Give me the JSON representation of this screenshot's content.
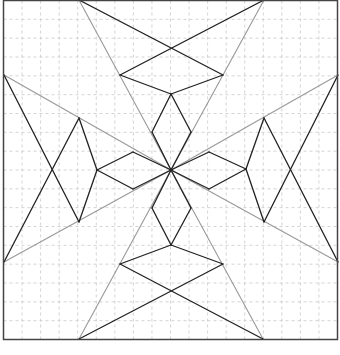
{
  "diagram": {
    "title": "",
    "frame": {
      "x": 3.5,
      "y": 0.5,
      "width": 334,
      "height": 339,
      "stroke": "#444444",
      "stroke_width": 1.5
    },
    "grid": {
      "divisions": 18,
      "stroke": "#c8c8c8",
      "dash": "3,3",
      "stroke_width": 0.8
    },
    "colors": {
      "black_line": "#222222",
      "gray_line": "#999999"
    },
    "center": [
      171,
      170
    ],
    "black_lines": [
      [
        79,
        0,
        223,
        75
      ],
      [
        264,
        0,
        120,
        75
      ],
      [
        120,
        75,
        171,
        94
      ],
      [
        223,
        75,
        171,
        94
      ],
      [
        171,
        94,
        152,
        132
      ],
      [
        152,
        132,
        171,
        170
      ],
      [
        171,
        94,
        191,
        132
      ],
      [
        191,
        132,
        171,
        170
      ],
      [
        79,
        339,
        223,
        264
      ],
      [
        263,
        339,
        120,
        264
      ],
      [
        120,
        264,
        171,
        245
      ],
      [
        223,
        264,
        171,
        245
      ],
      [
        171,
        245,
        152,
        208
      ],
      [
        152,
        208,
        171,
        170
      ],
      [
        171,
        245,
        191,
        208
      ],
      [
        191,
        208,
        171,
        170
      ],
      [
        4,
        75,
        79,
        222
      ],
      [
        4,
        262,
        79,
        118
      ],
      [
        79,
        118,
        97,
        170
      ],
      [
        79,
        222,
        97,
        170
      ],
      [
        97,
        170,
        133,
        152
      ],
      [
        133,
        152,
        171,
        170
      ],
      [
        97,
        170,
        133,
        189
      ],
      [
        133,
        189,
        171,
        170
      ],
      [
        338,
        75,
        264,
        222
      ],
      [
        338,
        262,
        264,
        118
      ],
      [
        264,
        118,
        246,
        169
      ],
      [
        264,
        222,
        246,
        169
      ],
      [
        246,
        169,
        209,
        152
      ],
      [
        209,
        152,
        171,
        170
      ],
      [
        246,
        169,
        209,
        189
      ],
      [
        209,
        189,
        171,
        170
      ]
    ],
    "gray_lines": [
      [
        79,
        0,
        171,
        170
      ],
      [
        264,
        0,
        171,
        170
      ],
      [
        79,
        339,
        171,
        170
      ],
      [
        263,
        339,
        171,
        170
      ],
      [
        4,
        75,
        171,
        170
      ],
      [
        4,
        262,
        171,
        170
      ],
      [
        338,
        75,
        171,
        170
      ],
      [
        338,
        262,
        171,
        170
      ]
    ]
  }
}
